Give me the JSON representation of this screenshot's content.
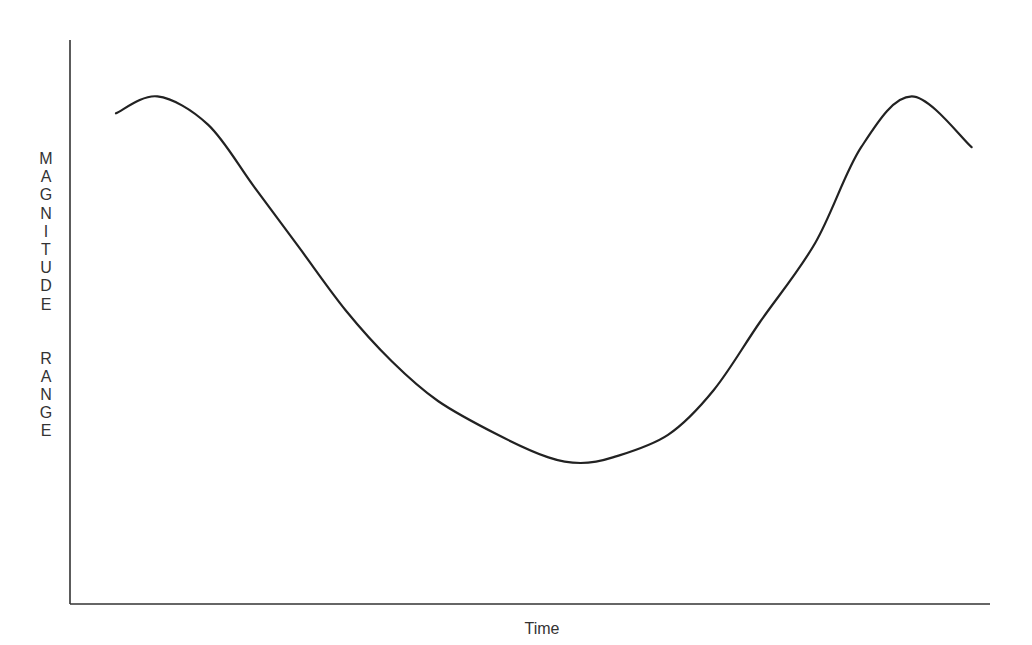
{
  "chart_data": {
    "type": "line",
    "title": "",
    "xlabel": "Time",
    "ylabel": "MAGNITUDE RANGE",
    "ylabel_orientation": "vertical-stacked-letters",
    "grid": false,
    "legend": null,
    "ticks": {
      "x": [],
      "y": []
    },
    "axis_ranges": {
      "x": [
        0,
        100
      ],
      "y": [
        0,
        100
      ]
    },
    "series": [
      {
        "name": "magnitude",
        "description": "U-shaped curve: high at start, declines to a minimum around 60% of time, rises back to the same high near the end",
        "x": [
          5,
          9.5,
          15,
          20,
          25,
          30,
          35,
          40,
          46.5,
          52,
          55.5,
          59,
          65,
          70,
          75,
          81,
          86,
          91.5,
          98
        ],
        "y": [
          87,
          90,
          85,
          74,
          63,
          52,
          43,
          36,
          30,
          26,
          25,
          26,
          30,
          38,
          50,
          64,
          81,
          90,
          81
        ]
      }
    ],
    "key_points": {
      "left_peak": {
        "x": 9.5,
        "y": 90
      },
      "minimum": {
        "x": 59,
        "y": 25
      },
      "right_peak": {
        "x": 91.5,
        "y": 90
      }
    }
  },
  "labels": {
    "y_axis_letters_word1": [
      "M",
      "A",
      "G",
      "N",
      "I",
      "T",
      "U",
      "D",
      "E"
    ],
    "y_axis_letters_word2": [
      "R",
      "A",
      "N",
      "G",
      "E"
    ],
    "x_axis": "Time"
  },
  "style": {
    "line_color": "#222222",
    "axis_color": "#333333",
    "text_color": "#333333"
  }
}
